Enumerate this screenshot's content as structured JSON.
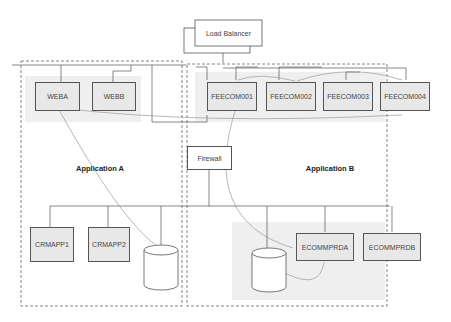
{
  "diagram": {
    "load_balancer": "Load Balancer",
    "firewall": "Firewall",
    "zones": {
      "app_a": "Application A",
      "app_b": "Application B"
    },
    "web_servers": [
      "WEBA",
      "WEBB"
    ],
    "fe_servers": [
      "FEECOM001",
      "FEECOM002",
      "FEECOM003",
      "FEECOM004"
    ],
    "crm_servers": [
      "CRMAPP1",
      "CRMAPP2"
    ],
    "ecomm_servers": [
      "ECOMMPRDA",
      "ECOMMPRDB"
    ],
    "colors": {
      "box_fill": "#e8e8e8",
      "group_fill": "#f0f0f0",
      "line": "#555555",
      "curve": "#999999"
    }
  }
}
